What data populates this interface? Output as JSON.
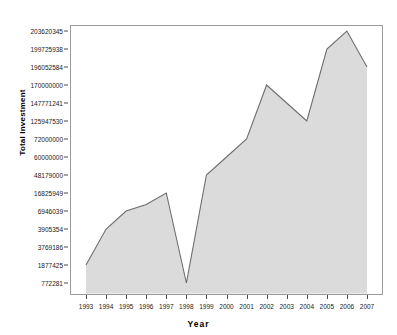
{
  "chart_data": {
    "type": "area",
    "title": "",
    "xlabel": "Year",
    "ylabel": "Total Investment",
    "grid": false,
    "legend": "none",
    "categories": [
      "1993",
      "1994",
      "1995",
      "1996",
      "1997",
      "1998",
      "1999",
      "2000",
      "2001",
      "2002",
      "2003",
      "2004",
      "2005",
      "2006",
      "2007"
    ],
    "y_tick_labels": [
      "203620345",
      "199725938",
      "196052584",
      "170000000",
      "147771241",
      "125947530",
      "72000000",
      "60000000",
      "48179000",
      "16825949",
      "6946039",
      "3905354",
      "3769186",
      "1877425",
      "772281"
    ],
    "y_axis_scale": "categorical-ordinal-ticks",
    "values": [
      1877425,
      3905354,
      6946039,
      10500000,
      16825949,
      772281,
      48179000,
      60000000,
      72000000,
      170000000,
      147771241,
      125947530,
      199725938,
      203620345,
      196052584
    ],
    "series": [
      {
        "name": "Total Investment",
        "values": [
          1877425,
          3905354,
          6946039,
          10500000,
          16825949,
          772281,
          48179000,
          60000000,
          72000000,
          170000000,
          147771241,
          125947530,
          199725938,
          203620345,
          196052584
        ]
      }
    ],
    "colors": {
      "area_fill": "#d9d9d9",
      "line": "#808080",
      "axis": "#808080",
      "text": "#1a1a1a",
      "background": "#ffffff"
    }
  }
}
